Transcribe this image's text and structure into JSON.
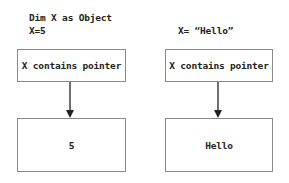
{
  "left": {
    "code_lines": [
      "Dim X as Object",
      "X=5"
    ],
    "pointer_box": "X contains pointer",
    "value_box": "5"
  },
  "right": {
    "code_lines": [
      "X= “Hello”"
    ],
    "pointer_box": "X contains pointer",
    "value_box": "Hello"
  }
}
